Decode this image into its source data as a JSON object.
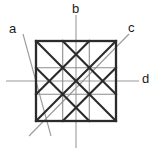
{
  "figure": {
    "title": "",
    "colors": {
      "background": "#ffffff",
      "thick_line": "#2b2b2b",
      "grid_line": "#8c8c8c",
      "axis_line": "#9a9a9a",
      "label_text": "#1a1a1a"
    },
    "square": {
      "x": 36,
      "y": 41,
      "width": 80,
      "height": 80,
      "divisions": 3
    },
    "labels": [
      {
        "id": "a",
        "text": "a",
        "axis": "diagonal-down-right",
        "position": "top-left"
      },
      {
        "id": "b",
        "text": "b",
        "axis": "vertical",
        "position": "top-center"
      },
      {
        "id": "c",
        "text": "c",
        "axis": "diagonal-down-left",
        "position": "top-right"
      },
      {
        "id": "d",
        "text": "d",
        "axis": "horizontal",
        "position": "middle-right"
      }
    ],
    "axes": [
      {
        "id": "a",
        "x1": 22,
        "y1": 33,
        "x2": 50,
        "y2": 135
      },
      {
        "id": "b",
        "x1": 76,
        "y1": 14,
        "x2": 76,
        "y2": 148
      },
      {
        "id": "c",
        "x1": 130,
        "y1": 33,
        "x2": 28,
        "y2": 135
      },
      {
        "id": "d",
        "x1": 6,
        "y1": 81,
        "x2": 140,
        "y2": 81
      }
    ]
  }
}
